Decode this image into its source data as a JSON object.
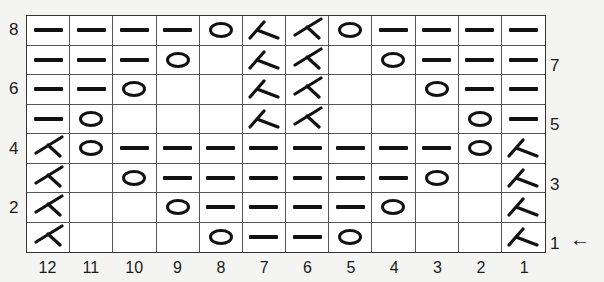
{
  "chart": {
    "columns": [
      "12",
      "11",
      "10",
      "9",
      "8",
      "7",
      "6",
      "5",
      "4",
      "3",
      "2",
      "1"
    ],
    "rows_left_labels": {
      "8": "8",
      "6": "6",
      "4": "4",
      "2": "2"
    },
    "rows_right_labels": {
      "7": "7",
      "5": "5",
      "3": "3",
      "1": "1"
    },
    "start_arrow": "←",
    "symbols": {
      "P": "purl-dash",
      "O": "yarn-over-circle",
      "R": "right-decrease-lambda",
      "L": "left-decrease-angle",
      "_": "empty"
    },
    "grid": [
      {
        "row": "8",
        "cells": [
          "P",
          "P",
          "P",
          "P",
          "O",
          "R",
          "L",
          "O",
          "P",
          "P",
          "P",
          "P"
        ]
      },
      {
        "row": "7",
        "cells": [
          "P",
          "P",
          "P",
          "O",
          "_",
          "R",
          "L",
          "_",
          "O",
          "P",
          "P",
          "P"
        ]
      },
      {
        "row": "6",
        "cells": [
          "P",
          "P",
          "O",
          "_",
          "_",
          "R",
          "L",
          "_",
          "_",
          "O",
          "P",
          "P"
        ]
      },
      {
        "row": "5",
        "cells": [
          "P",
          "O",
          "_",
          "_",
          "_",
          "R",
          "L",
          "_",
          "_",
          "_",
          "O",
          "P"
        ]
      },
      {
        "row": "4",
        "cells": [
          "L",
          "O",
          "P",
          "P",
          "P",
          "P",
          "P",
          "P",
          "P",
          "P",
          "O",
          "R"
        ]
      },
      {
        "row": "3",
        "cells": [
          "L",
          "_",
          "O",
          "P",
          "P",
          "P",
          "P",
          "P",
          "P",
          "O",
          "_",
          "R"
        ]
      },
      {
        "row": "2",
        "cells": [
          "L",
          "_",
          "_",
          "O",
          "P",
          "P",
          "P",
          "P",
          "O",
          "_",
          "_",
          "R"
        ]
      },
      {
        "row": "1",
        "cells": [
          "L",
          "_",
          "_",
          "_",
          "O",
          "P",
          "P",
          "O",
          "_",
          "_",
          "_",
          "R"
        ]
      }
    ]
  }
}
